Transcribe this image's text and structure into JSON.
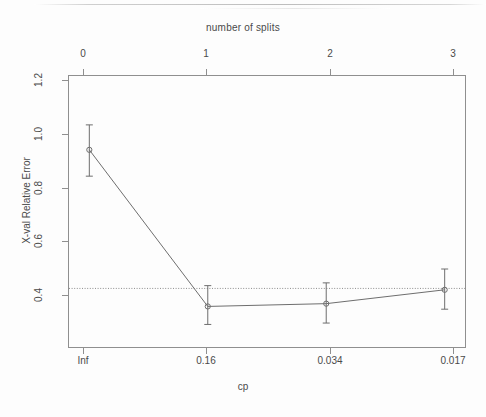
{
  "figure": {
    "type": "r-plotcp-figure",
    "background": "#fdfdfd",
    "foreground": "#4a4a4a"
  },
  "chart_data": {
    "type": "line",
    "title": "number of splits",
    "xlabel": "cp",
    "ylabel": "X-val Relative Error",
    "x_top_label": "number of splits",
    "categories": [
      "Inf",
      "0.16",
      "0.034",
      "0.017"
    ],
    "x": [
      0,
      1,
      2,
      3
    ],
    "x_tick_labels_top": [
      "0",
      "1",
      "2",
      "3"
    ],
    "x_tick_labels_bottom": [
      "Inf",
      "0.16",
      "0.034",
      "0.017"
    ],
    "values": [
      1.0,
      0.435,
      0.445,
      0.495
    ],
    "error_upper": [
      1.09,
      0.51,
      0.52,
      0.57
    ],
    "error_lower": [
      0.905,
      0.37,
      0.375,
      0.425
    ],
    "y_tick_labels": [
      "1.2",
      "1.0",
      "0.8",
      "0.6",
      "0.4"
    ],
    "y_ticks": [
      1.2,
      1.0,
      0.8,
      0.6,
      0.4
    ],
    "ylim": [
      0.285,
      1.27
    ],
    "xlim": [
      -0.18,
      3.18
    ],
    "hline": {
      "value": 0.5,
      "style": "dotted",
      "label": "1-SE threshold"
    },
    "grid": false,
    "legend": null,
    "series": [
      {
        "name": "X-val Relative Error",
        "values": [
          1.0,
          0.435,
          0.445,
          0.495
        ],
        "marker": "circle",
        "color": "#6e6e6e"
      }
    ],
    "line_color": "#6e6e6e",
    "errorbar_color": "#6e6e6e",
    "hline_color": "#8c8c8c"
  }
}
